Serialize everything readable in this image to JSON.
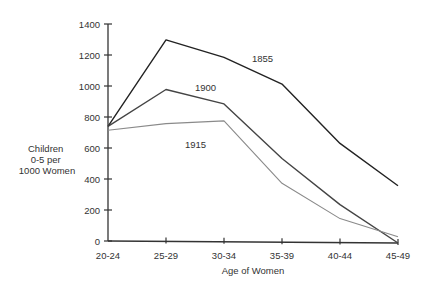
{
  "chart_data": {
    "type": "line",
    "title": "",
    "xlabel": "Age of Women",
    "ylabel_lines": [
      "Children",
      "0-5 per",
      "1000 Women"
    ],
    "ylabel": "Children 0-5 per 1000 Women",
    "categories": [
      "20-24",
      "25-29",
      "30-34",
      "35-39",
      "40-44",
      "45-49"
    ],
    "yticks": [
      0,
      200,
      400,
      600,
      800,
      1000,
      1200,
      1400
    ],
    "ylim": [
      0,
      1400
    ],
    "grid": false,
    "legend": "inline labels",
    "series": [
      {
        "name": "1855",
        "values": [
          740,
          1300,
          1190,
          1020,
          640,
          370
        ],
        "color": "#222222",
        "label_pos": [
          252,
          62
        ]
      },
      {
        "name": "1900",
        "values": [
          740,
          980,
          890,
          540,
          245,
          0
        ],
        "color": "#444444",
        "label_pos": [
          195,
          91
        ]
      },
      {
        "name": "1915",
        "values": [
          715,
          760,
          780,
          380,
          155,
          40
        ],
        "color": "#8a8a8a",
        "label_pos": [
          185,
          148
        ]
      }
    ]
  }
}
